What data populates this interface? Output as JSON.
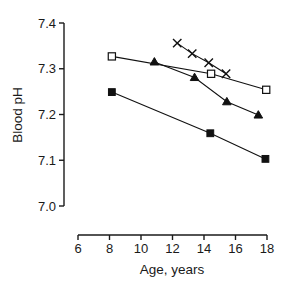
{
  "chart_data": {
    "type": "line",
    "title": "",
    "xlabel": "Age,  years",
    "ylabel": "Blood pH",
    "xlim": [
      6,
      18.6
    ],
    "ylim": [
      6.98,
      7.41
    ],
    "xticks": [
      6,
      8,
      10,
      12,
      14,
      16,
      18
    ],
    "xtick_labels": [
      "6",
      "8",
      "10",
      "12",
      "14",
      "16",
      "18"
    ],
    "yticks": [
      7.0,
      7.1,
      7.2,
      7.3,
      7.4
    ],
    "ytick_labels": [
      "7.0",
      "7.1",
      "7.2",
      "7.3",
      "7.4"
    ],
    "grid": false,
    "legend": "none",
    "series": [
      {
        "name": "open-square-series",
        "marker": "open-square",
        "x": [
          8.15,
          14.45,
          17.95
        ],
        "y": [
          7.327,
          7.289,
          7.254
        ]
      },
      {
        "name": "filled-triangle-series",
        "marker": "filled-triangle",
        "x": [
          10.85,
          13.4,
          15.45,
          17.45
        ],
        "y": [
          7.315,
          7.281,
          7.228,
          7.199
        ]
      },
      {
        "name": "cross-series",
        "marker": "x-cross",
        "x": [
          12.3,
          13.25,
          14.3,
          15.4
        ],
        "y": [
          7.356,
          7.333,
          7.313,
          7.289
        ]
      },
      {
        "name": "filled-square-series",
        "marker": "filled-square",
        "x": [
          8.15,
          14.4,
          17.9
        ],
        "y": [
          7.249,
          7.159,
          7.103
        ]
      }
    ]
  },
  "axes": {
    "y_title": "Blood pH",
    "x_title": "Age,  years"
  }
}
